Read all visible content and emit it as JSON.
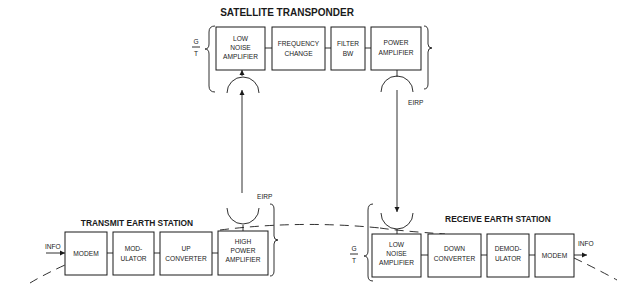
{
  "satellite": {
    "title": "SATELLITE TRANSPONDER",
    "g_over_t": {
      "numerator": "G",
      "denominator": "T"
    },
    "eirp_label": "EIRP",
    "blocks": [
      {
        "lines": [
          "LOW",
          "NOISE",
          "AMPLIFIER"
        ]
      },
      {
        "lines": [
          "FREQUENCY",
          "CHANGE"
        ]
      },
      {
        "lines": [
          "FILTER",
          "BW"
        ]
      },
      {
        "lines": [
          "POWER",
          "AMPLIFIER"
        ]
      }
    ]
  },
  "transmit": {
    "title": "TRANSMIT EARTH STATION",
    "input_label": "INFO",
    "eirp_label": "EIRP",
    "blocks": [
      {
        "lines": [
          "MODEM"
        ]
      },
      {
        "lines": [
          "MOD-",
          "ULATOR"
        ]
      },
      {
        "lines": [
          "UP",
          "CONVERTER"
        ]
      },
      {
        "lines": [
          "HIGH",
          "POWER",
          "AMPLIFIER"
        ]
      }
    ]
  },
  "receive": {
    "title": "RECEIVE EARTH STATION",
    "output_label": "INFO",
    "g_over_t": {
      "numerator": "G",
      "denominator": "T"
    },
    "blocks": [
      {
        "lines": [
          "LOW",
          "NOISE",
          "AMPLIFIER"
        ]
      },
      {
        "lines": [
          "DOWN",
          "CONVERTER"
        ]
      },
      {
        "lines": [
          "DEMOD-",
          "ULATOR"
        ]
      },
      {
        "lines": [
          "MODEM"
        ]
      }
    ]
  }
}
